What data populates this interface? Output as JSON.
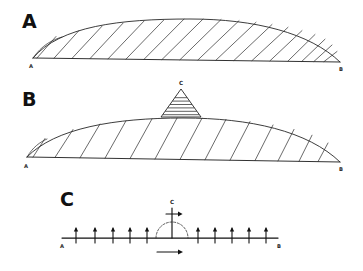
{
  "figure": {
    "background_color": "#ffffff",
    "ink_color": "#111111",
    "panels": [
      {
        "id": "A",
        "label": "A",
        "label_x": 22,
        "label_y": 22,
        "endpoints": {
          "left_label": "A",
          "right_label": "B"
        },
        "left_endpoint_x": 33,
        "right_endpoint_x": 340,
        "baseline_left_y": 58,
        "baseline_right_y": 62,
        "crest_y": 19,
        "hatch_count": 17,
        "hatch_style": "oblique-right-leaning",
        "description": "Lens shaped cross section with oblique hatching from baseline A-B to upper arc"
      },
      {
        "id": "B",
        "label": "B",
        "label_x": 22,
        "label_y": 100,
        "endpoints": {
          "left_label": "A",
          "right_label": "B"
        },
        "left_endpoint_x": 27,
        "right_endpoint_x": 340,
        "baseline_left_y": 157,
        "baseline_right_y": 162,
        "crest_y": 118,
        "hatch_count": 13,
        "hatch_style": "steep-oblique",
        "apex": {
          "label": "C",
          "label_x": 181,
          "label_y": 84,
          "apex_x": 181,
          "apex_y": 89,
          "base_left_x": 161,
          "base_right_x": 201,
          "base_y": 117,
          "hatch_count": 6,
          "hatch_style": "horizontal"
        },
        "description": "Lens shaped cross section with superposed hatched triangular peak at C"
      },
      {
        "id": "C",
        "label": "C",
        "label_x": 60,
        "label_y": 199,
        "endpoints": {
          "left_label": "A",
          "right_label": "B"
        },
        "axis_left_x": 62,
        "axis_right_x": 278,
        "axis_y": 238,
        "mast": {
          "label": "C",
          "label_x": 172,
          "label_y": 202,
          "base_x": 172,
          "base_y": 238,
          "top_y": 208,
          "cross_y": 214,
          "cross_half_width": 6
        },
        "arc": {
          "center_x": 172,
          "center_y": 238,
          "radius": 16,
          "style": "dashed-semicircle"
        },
        "horizontal_vector": {
          "start_x": 157,
          "end_x": 182,
          "y": 252,
          "direction": "right"
        },
        "left_vectors_count": 5,
        "right_vectors_count": 5,
        "left_vector_x": [
          76,
          95,
          113,
          130,
          147
        ],
        "right_vector_x": [
          198,
          215,
          232,
          249,
          266
        ],
        "vector_length": 11,
        "description": "Force or vector distribution diagram along axis A-B with upward vectors and central mast at C"
      }
    ]
  }
}
